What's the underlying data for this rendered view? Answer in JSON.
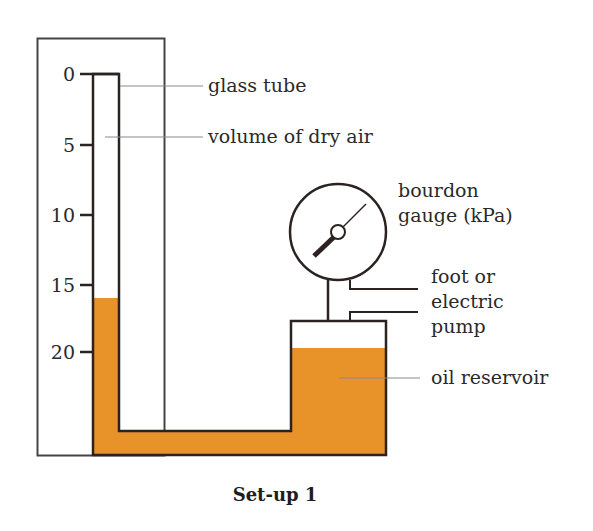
{
  "diagram": {
    "caption": "Set-up 1",
    "colors": {
      "oil": "#E8922A",
      "line": "#2b2320",
      "leader": "#8a8a8a"
    },
    "scale": {
      "ticks": [
        "0",
        "5",
        "10",
        "15",
        "20"
      ],
      "oil_level_reading": "16"
    },
    "labels": {
      "glass_tube": "glass tube",
      "volume_of_dry_air": "volume of dry air",
      "bourdon_line1": "bourdon",
      "bourdon_line2": "gauge (kPa)",
      "pump_line1": "foot or",
      "pump_line2": "electric",
      "pump_line3": "pump",
      "oil_reservoir": "oil reservoir"
    }
  }
}
